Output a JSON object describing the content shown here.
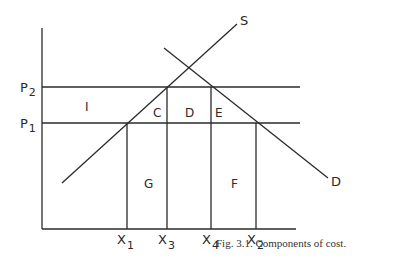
{
  "diagram": {
    "caption": "Fig. 3.1.  Components of cost.",
    "curves": {
      "supply": "S",
      "demand": "D"
    },
    "price_levels": [
      {
        "base": "P",
        "sub": "2"
      },
      {
        "base": "P",
        "sub": "1"
      }
    ],
    "quantities": [
      {
        "base": "X",
        "sub": "1"
      },
      {
        "base": "X",
        "sub": "3"
      },
      {
        "base": "X",
        "sub": "4"
      },
      {
        "base": "X",
        "sub": "2"
      }
    ],
    "regions": {
      "I": "I",
      "C": "C",
      "D": "D",
      "E": "E",
      "G": "G",
      "F": "F"
    },
    "colors": {
      "line": "#2a2a2a",
      "background": "#ffffff"
    }
  }
}
